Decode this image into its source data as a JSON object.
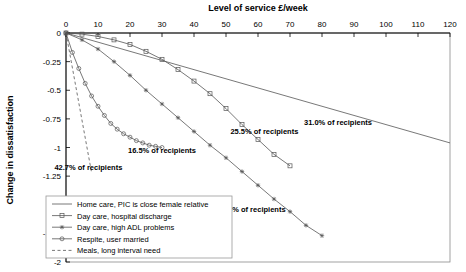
{
  "chart_data": {
    "type": "line",
    "title": "Level of service £/week",
    "xlabel": "Level of service £/week",
    "ylabel": "Change in dissatisfaction",
    "xlim": [
      0,
      120
    ],
    "ylim": [
      -2,
      0
    ],
    "xticks": [
      0,
      10,
      20,
      30,
      40,
      50,
      60,
      70,
      80,
      90,
      100,
      110,
      120
    ],
    "yticks": [
      0,
      -0.25,
      -0.5,
      -0.75,
      -1,
      -1.25,
      -1.5,
      -1.75,
      -2
    ],
    "xtick_labels": [
      "0",
      "10",
      "20",
      "30",
      "40",
      "50",
      "60",
      "70",
      "80",
      "90",
      "100",
      "110",
      "120"
    ],
    "ytick_labels": [
      "0",
      "-0.25",
      "-0.5",
      "-0.75",
      "-1",
      "-1.25",
      "-1.5",
      "-1.75",
      "-2"
    ],
    "grid": false,
    "legend_position": "bottom-left",
    "series": [
      {
        "name": "Home care, PIC is close female relative",
        "marker": "none",
        "dash": "solid",
        "points": [
          [
            0,
            0
          ],
          [
            120,
            -0.96
          ]
        ]
      },
      {
        "name": "Day care, hospital discharge",
        "marker": "square",
        "dash": "solid",
        "points": [
          [
            0,
            0
          ],
          [
            5,
            -0.01
          ],
          [
            10,
            -0.03
          ],
          [
            15,
            -0.06
          ],
          [
            20,
            -0.1
          ],
          [
            25,
            -0.16
          ],
          [
            30,
            -0.23
          ],
          [
            35,
            -0.32
          ],
          [
            40,
            -0.42
          ],
          [
            45,
            -0.53
          ],
          [
            50,
            -0.66
          ],
          [
            55,
            -0.8
          ],
          [
            60,
            -0.93
          ],
          [
            65,
            -1.06
          ],
          [
            70,
            -1.16
          ]
        ]
      },
      {
        "name": "Day care, high ADL problems",
        "marker": "star",
        "dash": "solid",
        "points": [
          [
            0,
            0
          ],
          [
            5,
            -0.06
          ],
          [
            10,
            -0.14
          ],
          [
            15,
            -0.25
          ],
          [
            20,
            -0.37
          ],
          [
            25,
            -0.5
          ],
          [
            30,
            -0.62
          ],
          [
            35,
            -0.74
          ],
          [
            40,
            -0.86
          ],
          [
            45,
            -0.98
          ],
          [
            50,
            -1.09
          ],
          [
            55,
            -1.21
          ],
          [
            60,
            -1.33
          ],
          [
            65,
            -1.45
          ],
          [
            70,
            -1.56
          ],
          [
            75,
            -1.68
          ],
          [
            80,
            -1.77
          ]
        ]
      },
      {
        "name": "Respite, user married",
        "marker": "circle",
        "dash": "solid",
        "points": [
          [
            0,
            0
          ],
          [
            2,
            -0.17
          ],
          [
            4,
            -0.31
          ],
          [
            6,
            -0.44
          ],
          [
            8,
            -0.55
          ],
          [
            10,
            -0.64
          ],
          [
            12,
            -0.72
          ],
          [
            14,
            -0.79
          ],
          [
            16,
            -0.84
          ],
          [
            18,
            -0.88
          ],
          [
            20,
            -0.91
          ],
          [
            22,
            -0.94
          ],
          [
            24,
            -0.96
          ],
          [
            26,
            -0.98
          ],
          [
            28,
            -0.99
          ],
          [
            30,
            -1.0
          ]
        ]
      },
      {
        "name": "Meals, long interval need",
        "marker": "none",
        "dash": "dashed",
        "points": [
          [
            0,
            0
          ],
          [
            8,
            -1.22
          ]
        ]
      }
    ],
    "annotations": [
      {
        "text": "31.0% of recipients",
        "x": 85,
        "y": -0.8
      },
      {
        "text": "25.5% of recipients",
        "x": 62,
        "y": -0.88
      },
      {
        "text": "16.5% of recipients",
        "x": 30,
        "y": -1.05
      },
      {
        "text": "42.7% of recipients",
        "x": 7,
        "y": -1.2
      },
      {
        "text": "22.8% of recipients",
        "x": 58,
        "y": -1.56
      }
    ]
  }
}
